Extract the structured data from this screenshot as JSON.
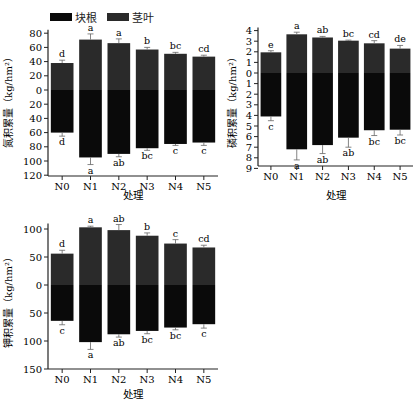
{
  "legend": [
    {
      "label": "块根",
      "color": "#0a0a0a"
    },
    {
      "label": "茎叶",
      "color": "#2a2a2a"
    }
  ],
  "chart_data": [
    {
      "type": "bar",
      "title": "",
      "xlabel": "处理",
      "ylabel": "氮积累量（kg/hm²）",
      "categories": [
        "N0",
        "N1",
        "N2",
        "N3",
        "N4",
        "N5"
      ],
      "series": [
        {
          "name": "茎叶",
          "direction": "up",
          "values": [
            38,
            71,
            66,
            57,
            51,
            47
          ],
          "errors": [
            4,
            8,
            6,
            3,
            2,
            2
          ],
          "letters": [
            "d",
            "a",
            "a",
            "b",
            "bc",
            "cd"
          ]
        },
        {
          "name": "块根",
          "direction": "down",
          "values": [
            60,
            95,
            90,
            82,
            76,
            74
          ],
          "errors": [
            5,
            10,
            4,
            3,
            2,
            4
          ],
          "letters": [
            "d",
            "a",
            "ab",
            "bc",
            "c",
            "c"
          ]
        }
      ],
      "yticks_up": [
        0,
        20,
        40,
        60,
        80
      ],
      "yticks_down": [
        20,
        40,
        60,
        80,
        100,
        120
      ],
      "ylim": [
        -120,
        85
      ],
      "grid": false
    },
    {
      "type": "bar",
      "title": "",
      "xlabel": "处理",
      "ylabel": "磷积累量（kg/hm²）",
      "categories": [
        "N0",
        "N1",
        "N2",
        "N3",
        "N4",
        "N5"
      ],
      "series": [
        {
          "name": "茎叶",
          "direction": "up",
          "values": [
            1.95,
            3.65,
            3.35,
            3.05,
            2.8,
            2.3
          ],
          "errors": [
            0.15,
            0.2,
            0.1,
            0.05,
            0.25,
            0.3
          ],
          "letters": [
            "e",
            "a",
            "ab",
            "bc",
            "cd",
            "de"
          ]
        },
        {
          "name": "块根",
          "direction": "down",
          "values": [
            4.1,
            7.2,
            6.8,
            6.1,
            5.4,
            5.35
          ],
          "errors": [
            0.4,
            1.0,
            0.8,
            0.9,
            0.5,
            0.5
          ],
          "letters": [
            "c",
            "a",
            "ab",
            "ab",
            "bc",
            "bc"
          ]
        }
      ],
      "yticks_up": [
        0,
        1,
        2,
        3,
        4
      ],
      "yticks_down": [
        1,
        2,
        3,
        4,
        5,
        6,
        7,
        8,
        9
      ],
      "ylim": [
        -9,
        4.3
      ],
      "grid": false
    },
    {
      "type": "bar",
      "title": "",
      "xlabel": "处理",
      "ylabel": "钾积累量（kg/hm²）",
      "categories": [
        "N0",
        "N1",
        "N2",
        "N3",
        "N4",
        "N5"
      ],
      "series": [
        {
          "name": "茎叶",
          "direction": "up",
          "values": [
            56,
            103,
            98,
            88,
            74,
            67
          ],
          "errors": [
            6,
            2,
            10,
            5,
            7,
            4
          ],
          "letters": [
            "d",
            "a",
            "ab",
            "b",
            "c",
            "cd"
          ]
        },
        {
          "name": "块根",
          "direction": "down",
          "values": [
            64,
            102,
            88,
            82,
            76,
            70
          ],
          "errors": [
            7,
            13,
            5,
            5,
            4,
            7
          ],
          "letters": [
            "c",
            "a",
            "ab",
            "bc",
            "bc",
            "c"
          ]
        }
      ],
      "yticks_up": [
        0,
        50,
        100
      ],
      "yticks_down": [
        50,
        100,
        150
      ],
      "ylim": [
        -150,
        110
      ],
      "grid": false
    }
  ]
}
